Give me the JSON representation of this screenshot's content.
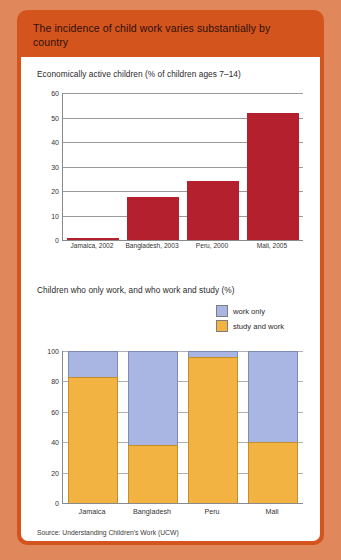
{
  "card": {
    "title": "The incidence of child work varies substantially by country",
    "source": "Source: Understanding Children's Work (UCW)",
    "header_color": "#D4541E",
    "page_background": "#E0875B"
  },
  "chart_data": [
    {
      "type": "bar",
      "title": "Economically active children (% of children ages 7–14)",
      "categories": [
        "Jamaica, 2002",
        "Bangladesh, 2003",
        "Peru, 2000",
        "Mali, 2005"
      ],
      "values": [
        1.0,
        17.5,
        24.2,
        52.0
      ],
      "xlabel": "",
      "ylabel": "",
      "ylim": [
        0,
        60
      ],
      "yticks": [
        0,
        10,
        20,
        30,
        40,
        50,
        60
      ],
      "grid": true,
      "legend": "none",
      "bar_color": "#B5202F"
    },
    {
      "type": "bar",
      "title": "Children who only work, and who work and study (%)",
      "stacked": true,
      "categories": [
        "Jamaica",
        "Bangladesh",
        "Peru",
        "Mali"
      ],
      "series": [
        {
          "name": "study and work",
          "color": "#F3B342",
          "values": [
            83,
            38,
            96,
            40
          ]
        },
        {
          "name": "work only",
          "color": "#A9B5E2",
          "values": [
            17,
            62,
            4,
            60
          ]
        }
      ],
      "xlabel": "",
      "ylabel": "",
      "ylim": [
        0,
        100
      ],
      "yticks": [
        0,
        20,
        40,
        60,
        80,
        100
      ],
      "grid": true,
      "legend": "top-right"
    }
  ]
}
